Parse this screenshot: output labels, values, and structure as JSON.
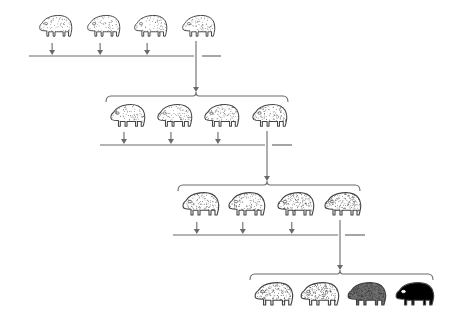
{
  "diagram": {
    "title": "Successive generations of selection toward darker coloration",
    "ink_color": "#555555",
    "line_color": "#6a6a6a",
    "animal_outline_color": "#444444",
    "background": "#ffffff",
    "generations": [
      {
        "index": 1,
        "label": "Generation 1",
        "animals": [
          {
            "x": 37,
            "y": 13,
            "w": 36,
            "h": 25,
            "shade": "#ffffff",
            "stipple": 0.18,
            "selected": false
          },
          {
            "x": 85,
            "y": 13,
            "w": 36,
            "h": 25,
            "shade": "#ffffff",
            "stipple": 0.18,
            "selected": false
          },
          {
            "x": 132,
            "y": 13,
            "w": 36,
            "h": 25,
            "shade": "#ffffff",
            "stipple": 0.2,
            "selected": false
          },
          {
            "x": 180,
            "y": 13,
            "w": 36,
            "h": 25,
            "shade": "#ffffff",
            "stipple": 0.22,
            "selected": true
          }
        ],
        "line": {
          "y": 56,
          "x1": 29,
          "x2": 194,
          "stub_x1": 202,
          "stub_x2": 221
        },
        "drop_arrow_x": 196,
        "drop_arrow_y1": 41,
        "drop_arrow_y2": 92
      },
      {
        "index": 2,
        "label": "Generation 2",
        "brace": {
          "x1": 106,
          "x2": 288,
          "y": 96,
          "notch_x": 196
        },
        "animals": [
          {
            "x": 108,
            "y": 102,
            "w": 38,
            "h": 26,
            "shade": "#ffffff",
            "stipple": 0.25,
            "selected": false
          },
          {
            "x": 155,
            "y": 102,
            "w": 38,
            "h": 26,
            "shade": "#ffffff",
            "stipple": 0.26,
            "selected": false
          },
          {
            "x": 202,
            "y": 102,
            "w": 38,
            "h": 26,
            "shade": "#ffffff",
            "stipple": 0.28,
            "selected": false
          },
          {
            "x": 250,
            "y": 102,
            "w": 38,
            "h": 26,
            "shade": "#ffffff",
            "stipple": 0.34,
            "selected": true
          }
        ],
        "line": {
          "y": 145,
          "x1": 100,
          "x2": 265,
          "stub_x1": 272,
          "stub_x2": 292
        },
        "drop_arrow_x": 267,
        "drop_arrow_y1": 131,
        "drop_arrow_y2": 181
      },
      {
        "index": 3,
        "label": "Generation 3",
        "brace": {
          "x1": 178,
          "x2": 360,
          "y": 185,
          "notch_x": 267
        },
        "animals": [
          {
            "x": 180,
            "y": 190,
            "w": 40,
            "h": 27,
            "shade": "#ffffff",
            "stipple": 0.32,
            "selected": false
          },
          {
            "x": 226,
            "y": 190,
            "w": 40,
            "h": 27,
            "shade": "#ffffff",
            "stipple": 0.36,
            "selected": false
          },
          {
            "x": 275,
            "y": 190,
            "w": 40,
            "h": 27,
            "shade": "#ffffff",
            "stipple": 0.42,
            "selected": false
          },
          {
            "x": 322,
            "y": 190,
            "w": 40,
            "h": 27,
            "shade": "#ffffff",
            "stipple": 0.5,
            "selected": true
          }
        ],
        "line": {
          "y": 235,
          "x1": 173,
          "x2": 338,
          "stub_x1": 345,
          "stub_x2": 365
        },
        "drop_arrow_x": 340,
        "drop_arrow_y1": 220,
        "drop_arrow_y2": 270
      },
      {
        "index": 4,
        "label": "Generation 4",
        "brace": {
          "x1": 250,
          "x2": 433,
          "y": 274,
          "notch_x": 340
        },
        "animals": [
          {
            "x": 252,
            "y": 280,
            "w": 42,
            "h": 27,
            "shade": "#ffffff",
            "stipple": 0.5,
            "selected": false
          },
          {
            "x": 298,
            "y": 280,
            "w": 42,
            "h": 27,
            "shade": "#ffffff",
            "stipple": 0.6,
            "selected": false
          },
          {
            "x": 345,
            "y": 280,
            "w": 42,
            "h": 27,
            "shade": "#6e6e6e",
            "stipple": 0.85,
            "selected": false
          },
          {
            "x": 393,
            "y": 280,
            "w": 42,
            "h": 27,
            "shade": "#000000",
            "stipple": 0,
            "selected": false
          }
        ]
      }
    ],
    "small_arrows": {
      "length": 10,
      "head": 4
    }
  }
}
